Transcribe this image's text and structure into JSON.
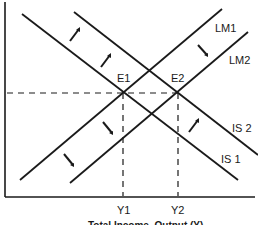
{
  "diagram": {
    "type": "IS-LM model",
    "x_axis_label": "Total Income, Output (Y)",
    "curves": {
      "lm1": "LM1",
      "lm2": "LM2",
      "is1": "IS 1",
      "is2": "IS 2"
    },
    "equilibria": {
      "e1": "E1",
      "e2": "E2"
    },
    "ticks": {
      "y1": "Y1",
      "y2": "Y2"
    },
    "colors": {
      "line": "#1a1a1a",
      "background": "#ffffff"
    }
  }
}
